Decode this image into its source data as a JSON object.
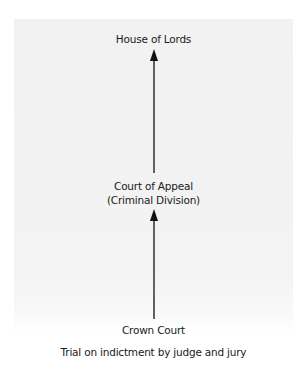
{
  "diagram": {
    "nodes": [
      {
        "id": "house-of-lords",
        "label": "House of Lords"
      },
      {
        "id": "court-of-appeal",
        "label_line1": "Court of Appeal",
        "label_line2": "(Criminal Division)"
      },
      {
        "id": "crown-court",
        "label": "Crown Court"
      }
    ],
    "caption": "Trial on indictment by judge and jury",
    "edges": [
      {
        "from": "crown-court",
        "to": "court-of-appeal",
        "direction": "up"
      },
      {
        "from": "court-of-appeal",
        "to": "house-of-lords",
        "direction": "up"
      }
    ],
    "colors": {
      "panel_background": "#f3f3f3",
      "arrow": "#111111",
      "text": "#1a1a1a"
    }
  }
}
